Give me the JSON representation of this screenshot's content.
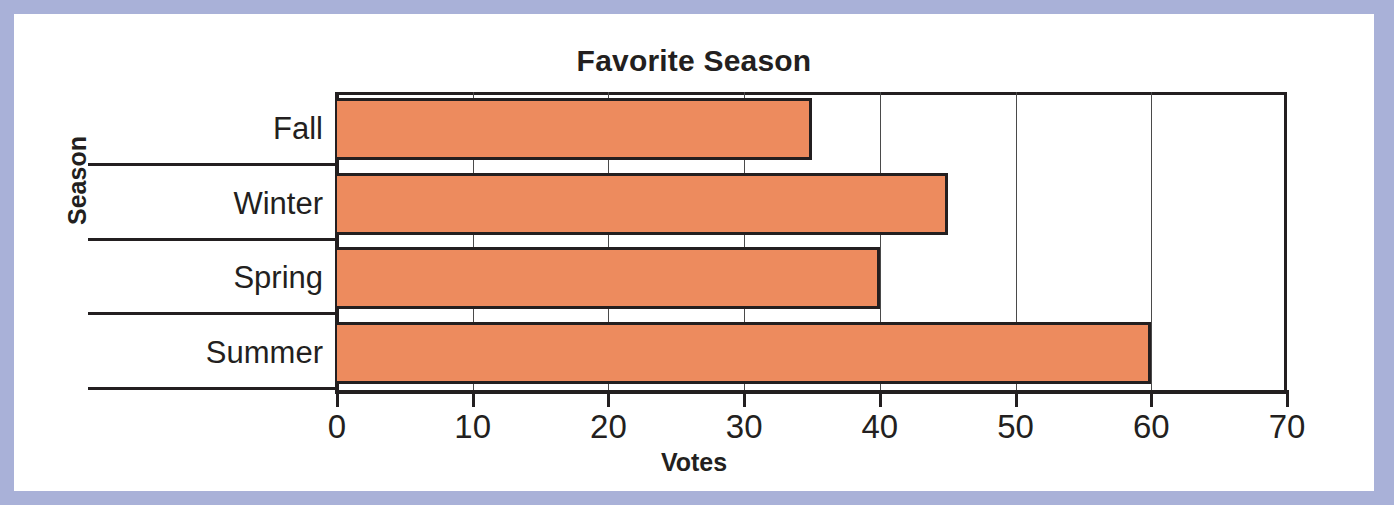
{
  "chart_data": {
    "type": "bar",
    "orientation": "horizontal",
    "title": "Favorite Season",
    "xlabel": "Votes",
    "ylabel": "Season",
    "categories": [
      "Fall",
      "Winter",
      "Spring",
      "Summer"
    ],
    "values": [
      35,
      45,
      40,
      60
    ],
    "xlim": [
      0,
      70
    ],
    "xticks": [
      0,
      10,
      20,
      30,
      40,
      50,
      60,
      70
    ],
    "xticklabels": [
      "0",
      "10",
      "20",
      "30",
      "40",
      "50",
      "60",
      "70"
    ],
    "grid": "vertical",
    "legend": null,
    "bar_color": "#ed8b5e",
    "bar_edge_color": "#231f20",
    "axis_color": "#231f20",
    "plot_background": "#ffffff",
    "page_background": "#a9b1d8"
  }
}
